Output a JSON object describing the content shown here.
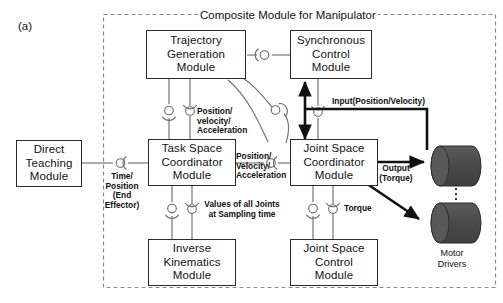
{
  "figure": {
    "panel_label": "(a)",
    "frame_title": "Composite Module for Manipulator"
  },
  "nodes": {
    "direct_teaching": {
      "lines": [
        "Direct",
        "Teaching",
        "Module"
      ]
    },
    "trajectory_generation": {
      "lines": [
        "Trajectory",
        "Generation",
        "Module"
      ]
    },
    "synchronous_control": {
      "lines": [
        "Synchronous",
        "Control",
        "Module"
      ]
    },
    "task_space_coordinator": {
      "lines": [
        "Task Space",
        "Coordinator",
        "Module"
      ]
    },
    "joint_space_coordinator": {
      "lines": [
        "Joint Space",
        "Coordinator",
        "Module"
      ]
    },
    "inverse_kinematics": {
      "lines": [
        "Inverse",
        "Kinematics",
        "Module"
      ]
    },
    "joint_space_control": {
      "lines": [
        "Joint Space",
        "Control",
        "Module"
      ]
    },
    "motor_drivers": {
      "caption_lines": [
        "Motor",
        "Drivers"
      ]
    }
  },
  "edge_labels": {
    "time_position": [
      "Time/",
      "Position",
      "(End",
      "Effector)"
    ],
    "pos_vel_accel_vertical": [
      "Position/",
      "velocity/",
      "Acceleration"
    ],
    "pos_vel_accel_horizontal": [
      "Position/",
      "Velocity/",
      "Acceleration"
    ],
    "values_all_joints": [
      "Values of all Joints",
      "at Sampling time"
    ],
    "torque": "Torque",
    "input_position_velocity": "Input(Position/Velocity)",
    "output_torque": [
      "Output",
      "(Torque)"
    ]
  },
  "colors": {
    "box_stroke": "#2b2b2b",
    "frame_stroke": "#8a8a8a",
    "connector_stroke": "#6f6f6f",
    "thick_arrow": "#111111",
    "motor_fill": "#4d4d4d",
    "motor_cap": "#595959",
    "text": "#121212",
    "background": "#ffffff"
  },
  "icons": {
    "provided_interface": "ball-icon",
    "required_interface": "socket-icon"
  }
}
